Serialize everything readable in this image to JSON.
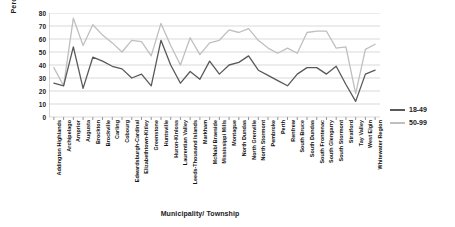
{
  "chart_data": {
    "type": "line",
    "title": "",
    "xlabel": "Municipality/ Township",
    "ylabel": "Percent",
    "ylim": [
      0,
      80
    ],
    "ytick_step": 10,
    "yticks": [
      0,
      10,
      20,
      30,
      40,
      50,
      60,
      70,
      80
    ],
    "grid": true,
    "legend_position": "right",
    "categories": [
      "Addington Highlands",
      "Archipelago",
      "Arnprior",
      "Augusta",
      "Brockton",
      "Brockville",
      "Carling",
      "Cobourg",
      "Edwardsburgh-Cardinal",
      "Elizabethtown-Kitley",
      "Greenstone",
      "Huntsville",
      "Huron-Kinloss",
      "Laurentian Valley",
      "Leeds-Thousand Islands",
      "Markham",
      "McNab/ Braeside",
      "Mississippi Mills",
      "Montague",
      "North Dundas",
      "North Grenville",
      "North Stormont",
      "Pembroke",
      "Perth",
      "Renfrew",
      "South Bruce",
      "South Dundas",
      "South Frontenac",
      "South Glengarry",
      "South Stormont",
      "Stratford",
      "Tay Valley",
      "West Elgin",
      "Whitewater Region"
    ],
    "series": [
      {
        "name": "18-49",
        "color": "#595959",
        "values": [
          26,
          24,
          54,
          22,
          46,
          43,
          39,
          37,
          30,
          33,
          24,
          59,
          40,
          26,
          35,
          29,
          43,
          33,
          40,
          42,
          47,
          36,
          32,
          28,
          24,
          33,
          38,
          38,
          33,
          39,
          25,
          12,
          33,
          36
        ]
      },
      {
        "name": "50-99",
        "color": "#bfbfbf",
        "values": [
          38,
          24,
          76,
          55,
          71,
          63,
          57,
          50,
          59,
          58,
          47,
          72,
          55,
          40,
          61,
          48,
          57,
          59,
          67,
          65,
          68,
          59,
          53,
          49,
          53,
          49,
          65,
          66,
          66,
          53,
          54,
          18,
          52,
          56
        ]
      }
    ]
  },
  "legend": {
    "items": [
      {
        "label": "18-49",
        "color": "#595959"
      },
      {
        "label": "50-99",
        "color": "#bfbfbf"
      }
    ]
  },
  "axes": {
    "y_title": "Percent",
    "x_title": "Municipality/ Township"
  }
}
